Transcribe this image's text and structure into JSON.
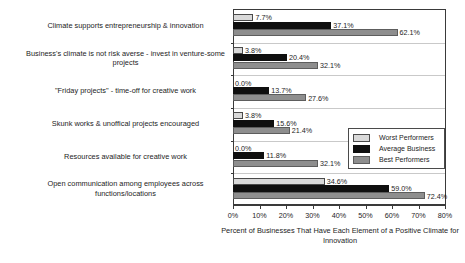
{
  "chart_data": {
    "type": "bar",
    "orientation": "horizontal",
    "title": "",
    "xlabel": "Percent of Businesses That Have Each Element of a Positive Climate for Innovation",
    "ylabel": "",
    "xlim": [
      0,
      80
    ],
    "xticks": [
      "0%",
      "10%",
      "20%",
      "30%",
      "40%",
      "50%",
      "60%",
      "70%",
      "80%"
    ],
    "grid": false,
    "legend_position": "middle-right",
    "categories": [
      "Climate supports entrepreneurship & innovation",
      "Business's climate is not risk averse - invest in venture-some projects",
      "\"Friday projects\" - time-off for creative work",
      "Skunk works & unoffical projects encouraged",
      "Resources available for creative work",
      "Open communication among employees across functions/locations"
    ],
    "series": [
      {
        "name": "Worst Performers",
        "color": "#d9d9d9",
        "values": [
          7.7,
          3.8,
          0.0,
          3.8,
          0.0,
          34.6
        ],
        "labels": [
          "7.7%",
          "3.8%",
          "0.0%",
          "3.8%",
          "0.0%",
          "34.6%"
        ]
      },
      {
        "name": "Average Business",
        "color": "#0f0f0f",
        "values": [
          37.1,
          20.4,
          13.7,
          15.6,
          11.8,
          59.0
        ],
        "labels": [
          "37.1%",
          "20.4%",
          "13.7%",
          "15.6%",
          "11.8%",
          "59.0%"
        ]
      },
      {
        "name": "Best Performers",
        "color": "#8e8e8e",
        "values": [
          62.1,
          32.1,
          27.6,
          21.4,
          32.1,
          72.4
        ],
        "labels": [
          "62.1%",
          "32.1%",
          "27.6%",
          "21.4%",
          "32.1%",
          "72.4%"
        ]
      }
    ]
  }
}
